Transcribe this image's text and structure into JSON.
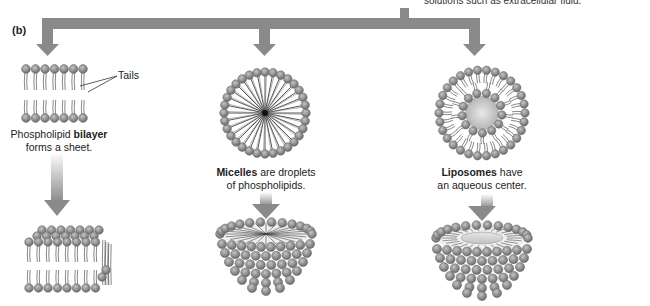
{
  "figure": {
    "part_label": "(b)",
    "top_note": "solutions such as extracellular fluid.",
    "colors": {
      "arrow": "#8a8a8a",
      "head_fill": "#9a9a9a",
      "head_stroke": "#6a6a6a",
      "tail": "#555555",
      "liposome_core": "#c8c8c8"
    }
  },
  "structures": [
    {
      "id": "bilayer",
      "callout": "Tails",
      "caption_bold": "bilayer",
      "caption_pre": "Phospholipid ",
      "caption_post": "",
      "caption_line2": "forms a sheet."
    },
    {
      "id": "micelle",
      "caption_bold": "Micelles",
      "caption_pre": "",
      "caption_post": " are droplets",
      "caption_line2": "of phospholipids."
    },
    {
      "id": "liposome",
      "caption_bold": "Liposomes",
      "caption_pre": "",
      "caption_post": " have",
      "caption_line2": "an aqueous center."
    }
  ]
}
